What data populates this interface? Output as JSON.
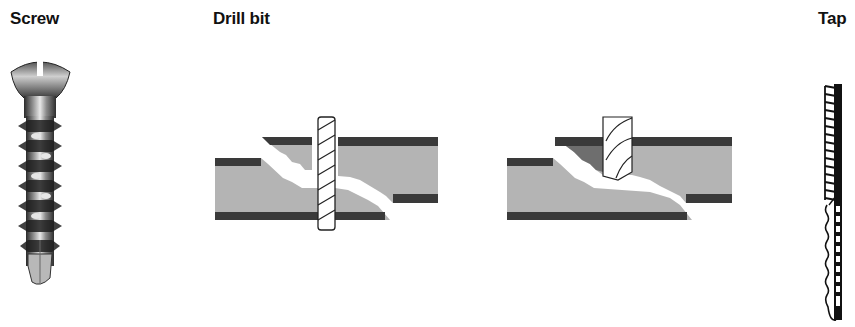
{
  "labels": {
    "screw": "Screw",
    "drill_bit": "Drill bit",
    "tap": "Tap"
  },
  "figures": [
    {
      "id": "screw",
      "description": "Cortical bone screw with slotted oval head and threaded shaft"
    },
    {
      "id": "drill-through-fracture",
      "description": "Twist drill bit passing through fractured bone cross-section"
    },
    {
      "id": "drill-entering-fracture",
      "description": "Drill bit tip entering upper cortex of fractured bone"
    },
    {
      "id": "tap",
      "description": "Bone tap with cutting threads"
    }
  ],
  "colors": {
    "cortex": "#3a3a3a",
    "cancellous": "#b4b4b4",
    "label_text": "#111111",
    "background": "#ffffff"
  }
}
